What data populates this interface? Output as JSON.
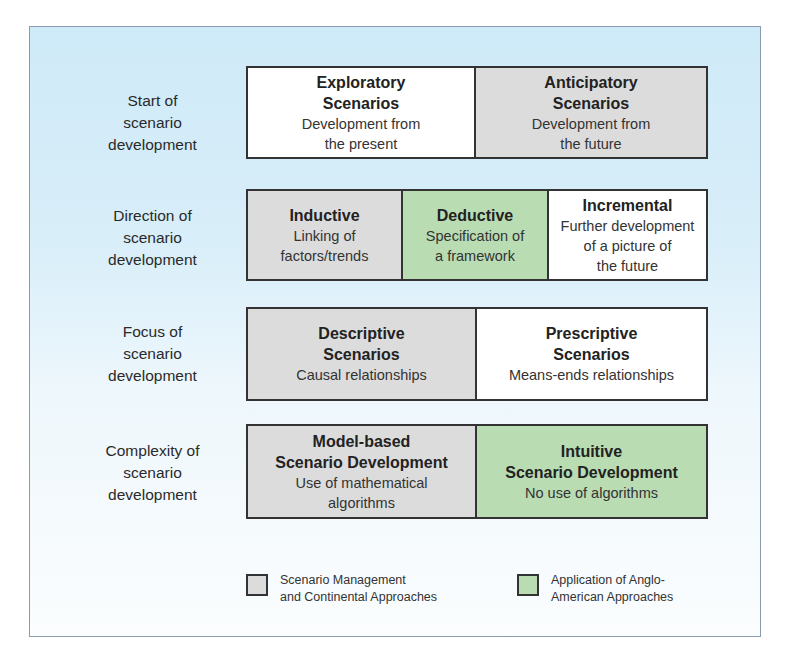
{
  "colors": {
    "panel_top": "#cfeaf8",
    "panel_bottom": "#fbfdfe",
    "grey": "#dcdcdc",
    "green": "#b9dcb3",
    "white": "#ffffff",
    "border": "#333333"
  },
  "rows": [
    {
      "label": [
        "Start of",
        "scenario",
        "development"
      ],
      "cells": [
        {
          "title": [
            "Exploratory",
            "Scenarios"
          ],
          "desc": [
            "Development from",
            "the present"
          ],
          "fill": "white"
        },
        {
          "title": [
            "Anticipatory",
            "Scenarios"
          ],
          "desc": [
            "Development from",
            "the future"
          ],
          "fill": "grey"
        }
      ]
    },
    {
      "label": [
        "Direction of",
        "scenario",
        "development"
      ],
      "cells": [
        {
          "title": [
            "Inductive"
          ],
          "desc": [
            "Linking of",
            "factors/trends"
          ],
          "fill": "grey"
        },
        {
          "title": [
            "Deductive"
          ],
          "desc": [
            "Specification of",
            "a framework"
          ],
          "fill": "green"
        },
        {
          "title": [
            "Incremental"
          ],
          "desc": [
            "Further development",
            "of a picture of",
            "the future"
          ],
          "fill": "white"
        }
      ]
    },
    {
      "label": [
        "Focus of",
        "scenario",
        "development"
      ],
      "cells": [
        {
          "title": [
            "Descriptive",
            "Scenarios"
          ],
          "desc": [
            "Causal relationships"
          ],
          "fill": "grey"
        },
        {
          "title": [
            "Prescriptive",
            "Scenarios"
          ],
          "desc": [
            "Means-ends relationships"
          ],
          "fill": "white"
        }
      ]
    },
    {
      "label": [
        "Complexity of",
        "scenario",
        "development"
      ],
      "cells": [
        {
          "title": [
            "Model-based",
            "Scenario Development"
          ],
          "desc": [
            "Use of mathematical",
            "algorithms"
          ],
          "fill": "grey"
        },
        {
          "title": [
            "Intuitive",
            "Scenario Development"
          ],
          "desc": [
            "No use of algorithms"
          ],
          "fill": "green"
        }
      ]
    }
  ],
  "legend": [
    {
      "text": "Scenario Management\nand Continental Approaches",
      "fill": "grey"
    },
    {
      "text": "Application of Anglo-\nAmerican Approaches",
      "fill": "green"
    }
  ]
}
